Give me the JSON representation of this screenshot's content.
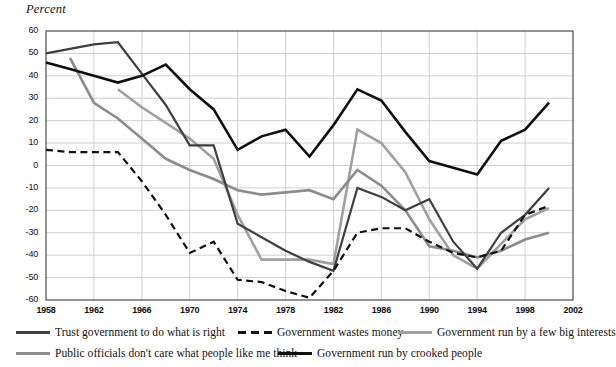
{
  "chart_data": {
    "type": "line",
    "title": "",
    "subtitle": "",
    "ylabel": "Percent",
    "xlabel": "",
    "ylim": [
      -60,
      60
    ],
    "xlim": [
      1958,
      2002
    ],
    "yticks": [
      60,
      50,
      40,
      30,
      20,
      10,
      0,
      -10,
      -20,
      -30,
      -40,
      -50,
      -60
    ],
    "xticks": [
      1958,
      1962,
      1966,
      1970,
      1974,
      1978,
      1982,
      1986,
      1990,
      1994,
      1998,
      2002
    ],
    "grid": true,
    "legend_position": "bottom",
    "x": [
      1958,
      1960,
      1962,
      1964,
      1966,
      1968,
      1970,
      1972,
      1974,
      1976,
      1978,
      1980,
      1982,
      1984,
      1986,
      1988,
      1990,
      1992,
      1994,
      1996,
      1998,
      2000
    ],
    "series": [
      {
        "name": "Trust government to do what is right",
        "color": "#3f3f3f",
        "style": "solid",
        "width": 2.2,
        "x": [
          1958,
          1960,
          1962,
          1964,
          1966,
          1968,
          1970,
          1972,
          1974,
          1976,
          1978,
          1980,
          1982,
          1984,
          1986,
          1988,
          1990,
          1992,
          1994,
          1996,
          1998,
          2000
        ],
        "values": [
          50,
          52,
          54,
          55,
          41,
          27,
          9,
          9,
          -26,
          -32,
          -38,
          -43,
          -47,
          -10,
          -14,
          -20,
          -15,
          -34,
          -46,
          -30,
          -22,
          -10
        ]
      },
      {
        "name": "Government wastes money",
        "color": "#111111",
        "style": "dashed",
        "width": 2.2,
        "x": [
          1958,
          1960,
          1962,
          1964,
          1966,
          1968,
          1970,
          1972,
          1974,
          1976,
          1978,
          1980,
          1982,
          1984,
          1986,
          1988,
          1990,
          1992,
          1994,
          1996,
          1998,
          2000
        ],
        "values": [
          7,
          6,
          6,
          6,
          -7,
          -22,
          -39,
          -34,
          -51,
          -52,
          -56,
          -59,
          -47,
          -30,
          -28,
          -28,
          -34,
          -39,
          -41,
          -38,
          -22,
          -18
        ]
      },
      {
        "name": "Government run by a few big interests",
        "color": "#a0a0a0",
        "style": "solid",
        "width": 2.6,
        "x": [
          1964,
          1966,
          1968,
          1970,
          1972,
          1974,
          1976,
          1978,
          1980,
          1982,
          1984,
          1986,
          1988,
          1990,
          1992,
          1994,
          1996,
          1998,
          2000
        ],
        "values": [
          34,
          26,
          19,
          12,
          3,
          -22,
          -42,
          -42,
          -42,
          -44,
          16,
          10,
          -3,
          -24,
          -40,
          -46,
          -35,
          -24,
          -19
        ]
      },
      {
        "name": "Public officials don't care what people like me think",
        "color": "#8c8c8c",
        "style": "solid",
        "width": 2.6,
        "x": [
          1960,
          1962,
          1964,
          1966,
          1968,
          1970,
          1972,
          1974,
          1976,
          1978,
          1980,
          1982,
          1984,
          1986,
          1988,
          1990,
          1992,
          1994,
          1996,
          1998,
          2000
        ],
        "values": [
          48,
          28,
          21,
          12,
          3,
          -2,
          -6,
          -11,
          -13,
          -12,
          -11,
          -15,
          -2,
          -9,
          -20,
          -36,
          -38,
          -41,
          -38,
          -33,
          -30
        ]
      },
      {
        "name": "Government run by crooked people",
        "color": "#101010",
        "style": "solid",
        "width": 2.6,
        "x": [
          1958,
          1960,
          1962,
          1964,
          1966,
          1968,
          1970,
          1972,
          1974,
          1976,
          1978,
          1980,
          1982,
          1984,
          1986,
          1988,
          1990,
          1992,
          1994,
          1996,
          1998,
          2000
        ],
        "values": [
          46,
          43,
          40,
          37,
          40,
          45,
          34,
          25,
          7,
          13,
          16,
          4,
          18,
          34,
          29,
          15,
          2,
          -1,
          -4,
          11,
          16,
          28
        ]
      }
    ]
  },
  "legend": {
    "items": [
      {
        "label": "Trust government to do what is right",
        "color": "#3f3f3f",
        "style": "solid",
        "row": 0,
        "left": 16
      },
      {
        "label": "Government wastes money",
        "color": "#111111",
        "style": "dashed",
        "row": 0,
        "left": 238
      },
      {
        "label": "Government run by a few big interests",
        "color": "#a0a0a0",
        "style": "solid",
        "row": 0,
        "left": 398
      },
      {
        "label": "Public officials don't care what people like me think",
        "color": "#8c8c8c",
        "style": "solid",
        "row": 1,
        "left": 16
      },
      {
        "label": "Government run by crooked people",
        "color": "#101010",
        "style": "solid",
        "row": 1,
        "left": 278
      }
    ]
  },
  "axes": {
    "y_title": "Percent",
    "y_labels": [
      "60",
      "50",
      "40",
      "30",
      "20",
      "10",
      "0",
      "-10",
      "-20",
      "-30",
      "-40",
      "-50",
      "-60"
    ],
    "x_labels": [
      "1958",
      "1962",
      "1966",
      "1970",
      "1974",
      "1978",
      "1982",
      "1986",
      "1990",
      "1994",
      "1998",
      "2002"
    ]
  },
  "colors": {
    "plot_border": "#3a3a3a",
    "gridline": "#c9c9c9",
    "background": "#ffffff",
    "text": "#111111"
  }
}
